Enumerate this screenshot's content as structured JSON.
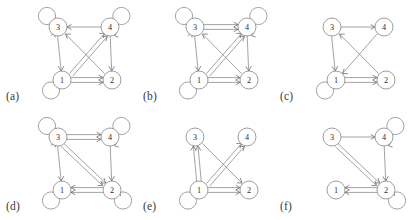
{
  "figure": {
    "panel_count": 6,
    "node_labels": [
      "1",
      "2",
      "3",
      "4"
    ],
    "stroke_color": "#8c8c8c",
    "node_fill": "#ffffff",
    "background": "#ffffff",
    "layout": {
      "columns": 3,
      "rows": 2,
      "panel_width": 137,
      "panel_height": 110
    }
  },
  "panels": [
    {
      "caption": "(a)",
      "nodes": [
        {
          "id": "3",
          "label": "3",
          "x": 32,
          "y": 25,
          "loop": "up-left"
        },
        {
          "id": "4",
          "label": "4",
          "x": 84,
          "y": 25,
          "loop": "up-right"
        },
        {
          "id": "1",
          "label": "1",
          "x": 36,
          "y": 78,
          "loop": "down-left"
        },
        {
          "id": "2",
          "label": "2",
          "x": 86,
          "y": 78,
          "loop": "none"
        }
      ],
      "edges": [
        {
          "from": "4",
          "to": "3",
          "multiplicity": 1,
          "style": "straight"
        },
        {
          "from": "3",
          "to": "1",
          "multiplicity": 1,
          "style": "straight"
        },
        {
          "from": "4",
          "to": "2",
          "multiplicity": 1,
          "style": "straight"
        },
        {
          "from": "1",
          "to": "2",
          "multiplicity": 2,
          "style": "parallel"
        },
        {
          "from": "1",
          "to": "4",
          "multiplicity": 2,
          "style": "parallel-diagonal"
        },
        {
          "from": "2",
          "to": "3",
          "multiplicity": 1,
          "style": "straight"
        }
      ],
      "self_loops": [
        "1",
        "3",
        "4"
      ]
    },
    {
      "caption": "(b)",
      "nodes": [
        {
          "id": "3",
          "label": "3",
          "x": 32,
          "y": 25,
          "loop": "up-left"
        },
        {
          "id": "4",
          "label": "4",
          "x": 84,
          "y": 25,
          "loop": "up-right"
        },
        {
          "id": "1",
          "label": "1",
          "x": 36,
          "y": 78,
          "loop": "down-left"
        },
        {
          "id": "2",
          "label": "2",
          "x": 86,
          "y": 78,
          "loop": "none"
        }
      ],
      "edges": [
        {
          "from": "3",
          "to": "4",
          "multiplicity": 2,
          "style": "parallel"
        },
        {
          "from": "3",
          "to": "1",
          "multiplicity": 1,
          "style": "straight"
        },
        {
          "from": "4",
          "to": "2",
          "multiplicity": 1,
          "style": "straight"
        },
        {
          "from": "1",
          "to": "2",
          "multiplicity": 2,
          "style": "parallel"
        },
        {
          "from": "1",
          "to": "4",
          "multiplicity": 2,
          "style": "parallel-diagonal"
        },
        {
          "from": "2",
          "to": "3",
          "multiplicity": 1,
          "style": "straight"
        }
      ],
      "self_loops": [
        "1",
        "3",
        "4"
      ]
    },
    {
      "caption": "(c)",
      "nodes": [
        {
          "id": "3",
          "label": "3",
          "x": 32,
          "y": 25,
          "loop": "none"
        },
        {
          "id": "4",
          "label": "4",
          "x": 84,
          "y": 25,
          "loop": "none"
        },
        {
          "id": "1",
          "label": "1",
          "x": 36,
          "y": 78,
          "loop": "down-left"
        },
        {
          "id": "2",
          "label": "2",
          "x": 86,
          "y": 78,
          "loop": "none"
        }
      ],
      "edges": [
        {
          "from": "3",
          "to": "4",
          "multiplicity": 1,
          "style": "straight"
        },
        {
          "from": "3",
          "to": "1",
          "multiplicity": 1,
          "style": "straight"
        },
        {
          "from": "4",
          "to": "1",
          "multiplicity": 1,
          "style": "diagonal"
        },
        {
          "from": "2",
          "to": "3",
          "multiplicity": 1,
          "style": "diagonal"
        },
        {
          "from": "1",
          "to": "2",
          "multiplicity": 2,
          "style": "parallel"
        }
      ],
      "self_loops": [
        "1"
      ]
    },
    {
      "caption": "(d)",
      "nodes": [
        {
          "id": "3",
          "label": "3",
          "x": 32,
          "y": 25,
          "loop": "up-left"
        },
        {
          "id": "4",
          "label": "4",
          "x": 84,
          "y": 25,
          "loop": "up-right"
        },
        {
          "id": "1",
          "label": "1",
          "x": 36,
          "y": 78,
          "loop": "down-left"
        },
        {
          "id": "2",
          "label": "2",
          "x": 86,
          "y": 78,
          "loop": "down-right"
        }
      ],
      "edges": [
        {
          "from": "3",
          "to": "4",
          "multiplicity": 2,
          "style": "parallel"
        },
        {
          "from": "3",
          "to": "1",
          "multiplicity": 1,
          "style": "straight"
        },
        {
          "from": "4",
          "to": "2",
          "multiplicity": 1,
          "style": "straight"
        },
        {
          "from": "3",
          "to": "2",
          "multiplicity": 2,
          "style": "parallel-diagonal"
        },
        {
          "from": "2",
          "to": "1",
          "multiplicity": 2,
          "style": "parallel"
        }
      ],
      "self_loops": [
        "1",
        "2",
        "3",
        "4"
      ]
    },
    {
      "caption": "(e)",
      "nodes": [
        {
          "id": "3",
          "label": "3",
          "x": 32,
          "y": 25,
          "loop": "none"
        },
        {
          "id": "4",
          "label": "4",
          "x": 84,
          "y": 25,
          "loop": "none"
        },
        {
          "id": "1",
          "label": "1",
          "x": 36,
          "y": 78,
          "loop": "down-left"
        },
        {
          "id": "2",
          "label": "2",
          "x": 86,
          "y": 78,
          "loop": "none"
        }
      ],
      "edges": [
        {
          "from": "1",
          "to": "3",
          "multiplicity": 2,
          "style": "parallel"
        },
        {
          "from": "1",
          "to": "4",
          "multiplicity": 2,
          "style": "parallel-diagonal"
        },
        {
          "from": "3",
          "to": "2",
          "multiplicity": 1,
          "style": "diagonal"
        },
        {
          "from": "1",
          "to": "2",
          "multiplicity": 2,
          "style": "parallel"
        }
      ],
      "self_loops": [
        "1"
      ]
    },
    {
      "caption": "(f)",
      "nodes": [
        {
          "id": "3",
          "label": "3",
          "x": 32,
          "y": 25,
          "loop": "none"
        },
        {
          "id": "4",
          "label": "4",
          "x": 84,
          "y": 25,
          "loop": "up-right"
        },
        {
          "id": "1",
          "label": "1",
          "x": 36,
          "y": 78,
          "loop": "none"
        },
        {
          "id": "2",
          "label": "2",
          "x": 86,
          "y": 78,
          "loop": "down-right"
        }
      ],
      "edges": [
        {
          "from": "3",
          "to": "4",
          "multiplicity": 1,
          "style": "straight"
        },
        {
          "from": "4",
          "to": "2",
          "multiplicity": 1,
          "style": "straight"
        },
        {
          "from": "3",
          "to": "2",
          "multiplicity": 2,
          "style": "parallel-diagonal"
        },
        {
          "from": "2",
          "to": "1",
          "multiplicity": 2,
          "style": "parallel"
        }
      ],
      "self_loops": [
        "2",
        "4"
      ]
    }
  ]
}
